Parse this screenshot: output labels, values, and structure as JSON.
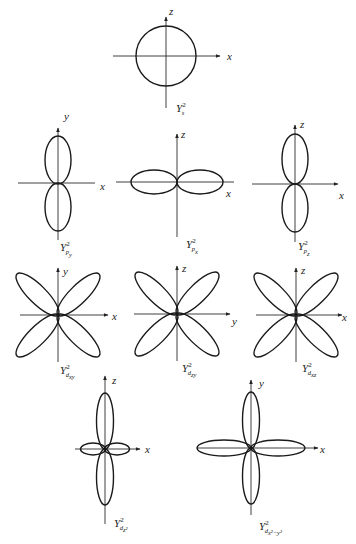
{
  "diagrams": [
    {
      "id": "s",
      "shape": "sphere",
      "axes": {
        "horizontal": "x",
        "vertical": "z"
      },
      "label": {
        "main": "Y",
        "sup": "2",
        "sub": "s"
      }
    },
    {
      "id": "py",
      "shape": "dumbbell-vertical",
      "axes": {
        "horizontal": "x",
        "vertical": "y"
      },
      "label": {
        "main": "Y",
        "sup": "2",
        "sub": "p",
        "subsub": "y"
      }
    },
    {
      "id": "px",
      "shape": "dumbbell-horizontal",
      "axes": {
        "horizontal": "x",
        "vertical": "z"
      },
      "label": {
        "main": "Y",
        "sup": "2",
        "sub": "p",
        "subsub": "x"
      }
    },
    {
      "id": "pz",
      "shape": "dumbbell-vertical",
      "axes": {
        "horizontal": "x",
        "vertical": "z"
      },
      "label": {
        "main": "Y",
        "sup": "2",
        "sub": "p",
        "subsub": "z"
      }
    },
    {
      "id": "dxy",
      "shape": "cloverleaf-diagonal",
      "axes": {
        "horizontal": "x",
        "vertical": "y"
      },
      "label": {
        "main": "Y",
        "sup": "2",
        "sub": "d",
        "subsub": "xy"
      }
    },
    {
      "id": "dzy",
      "shape": "cloverleaf-diagonal",
      "axes": {
        "horizontal": "y",
        "vertical": "z"
      },
      "label": {
        "main": "Y",
        "sup": "2",
        "sub": "d",
        "subsub": "zy"
      }
    },
    {
      "id": "dxz",
      "shape": "cloverleaf-diagonal",
      "axes": {
        "horizontal": "x",
        "vertical": "z"
      },
      "label": {
        "main": "Y",
        "sup": "2",
        "sub": "d",
        "subsub": "xz"
      }
    },
    {
      "id": "dz2",
      "shape": "dz2",
      "axes": {
        "horizontal": "x",
        "vertical": "z"
      },
      "label": {
        "main": "Y",
        "sup": "2",
        "sub": "d",
        "subsub": "z²"
      }
    },
    {
      "id": "dx2y2",
      "shape": "cloverleaf-axial",
      "axes": {
        "horizontal": "x",
        "vertical": "y"
      },
      "label": {
        "main": "Y",
        "sup": "2",
        "sub": "d",
        "subsub": "x²−y²"
      }
    }
  ]
}
